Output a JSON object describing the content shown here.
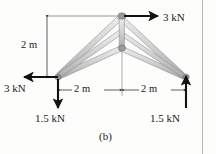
{
  "figure": {
    "caption": "(b)",
    "labels": {
      "top_force": "3 kN",
      "left_force": "3 kN",
      "height_dim": "2 m",
      "span_left": "2 m",
      "span_right": "2 m",
      "reaction_left": "1.5 kN",
      "reaction_right": "1.5 kN"
    },
    "colors": {
      "member_fill": "#d6d6d6",
      "member_edge": "#8c8c8c",
      "joint": "#7a7a7a",
      "arrow": "#111111",
      "dimension_line": "#4d4d4d",
      "background": "#fdfdfb",
      "border_rule": "#b7b7b7",
      "text": "#1a1a1a"
    },
    "geometry": {
      "apex": [
        122,
        16
      ],
      "left_support": [
        58,
        77
      ],
      "right_support": [
        186,
        77
      ],
      "center_joint": [
        122,
        48
      ],
      "units": "px"
    },
    "forces": [
      {
        "name": "applied-top",
        "magnitude": "3 kN",
        "direction": "right",
        "at": "apex"
      },
      {
        "name": "applied-left",
        "magnitude": "3 kN",
        "direction": "left",
        "at": "left-support"
      },
      {
        "name": "reaction-left",
        "magnitude": "1.5 kN",
        "direction": "down",
        "at": "left-support"
      },
      {
        "name": "reaction-right",
        "magnitude": "1.5 kN",
        "direction": "up",
        "at": "right-support"
      }
    ],
    "dimensions": [
      {
        "name": "height",
        "value": "2 m",
        "orientation": "vertical"
      },
      {
        "name": "span-left-half",
        "value": "2 m",
        "orientation": "horizontal"
      },
      {
        "name": "span-right-half",
        "value": "2 m",
        "orientation": "horizontal"
      }
    ]
  }
}
